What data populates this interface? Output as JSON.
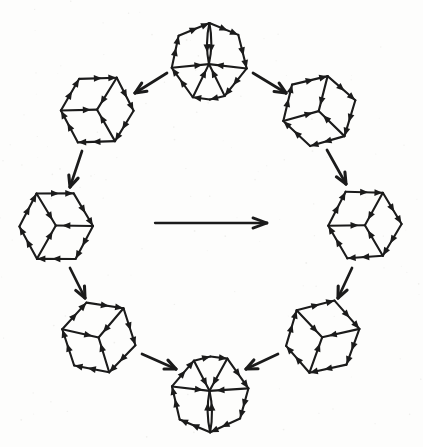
{
  "meta": {
    "ink_color": "#1b1b1b",
    "paper_color": "#fdfdfc",
    "speckle_color": "#e3e3e0"
  },
  "canvas": {
    "width": 423,
    "height": 447
  },
  "style": {
    "edge_width": 2.1,
    "head_length": 8.2,
    "head_width": 6.8,
    "connector_width": 2.7,
    "connector_barb_length": 12,
    "connector_barb_angle": 24,
    "central_width": 2.3,
    "central_barb_length": 15,
    "central_barb_angle": 20,
    "lens_half_width": 4.3
  },
  "cubes": [
    {
      "id": "top",
      "cx": 209,
      "cy": 61,
      "r": 39,
      "rotation": 0,
      "lens": true
    },
    {
      "id": "upper-right",
      "cx": 319,
      "cy": 111,
      "r": 37,
      "rotation": 15,
      "lens": false
    },
    {
      "id": "right",
      "cx": 365,
      "cy": 225,
      "r": 37,
      "rotation": 270,
      "lens": false
    },
    {
      "id": "lower-right",
      "cx": 322,
      "cy": 337,
      "r": 37,
      "rotation": 198,
      "lens": false
    },
    {
      "id": "bottom",
      "cx": 210,
      "cy": 394,
      "r": 38,
      "rotation": 180,
      "lens": true
    },
    {
      "id": "lower-left",
      "cx": 99,
      "cy": 337,
      "r": 37,
      "rotation": 162,
      "lens": false
    },
    {
      "id": "left",
      "cx": 56,
      "cy": 226,
      "r": 37,
      "rotation": 90,
      "lens": false
    },
    {
      "id": "upper-left",
      "cx": 97,
      "cy": 110,
      "r": 37,
      "rotation": 30,
      "lens": false
    }
  ],
  "transition_arrows": [
    {
      "id": "top-to-upper-left",
      "x1": 167,
      "y1": 73,
      "x2": 135,
      "y2": 93
    },
    {
      "id": "top-to-upper-right",
      "x1": 253,
      "y1": 73,
      "x2": 286,
      "y2": 93
    },
    {
      "id": "upper-left-to-left",
      "x1": 82,
      "y1": 151,
      "x2": 70,
      "y2": 187
    },
    {
      "id": "upper-right-to-right",
      "x1": 327,
      "y1": 150,
      "x2": 346,
      "y2": 184
    },
    {
      "id": "left-to-lower-left",
      "x1": 70,
      "y1": 268,
      "x2": 85,
      "y2": 298
    },
    {
      "id": "right-to-lower-right",
      "x1": 352,
      "y1": 268,
      "x2": 338,
      "y2": 298
    },
    {
      "id": "lower-left-to-bottom",
      "x1": 142,
      "y1": 354,
      "x2": 176,
      "y2": 369
    },
    {
      "id": "lower-right-to-bottom",
      "x1": 278,
      "y1": 354,
      "x2": 246,
      "y2": 369
    }
  ],
  "central_arrow": {
    "id": "central-arrow",
    "x1": 155,
    "y1": 223,
    "x2": 267,
    "y2": 223
  }
}
